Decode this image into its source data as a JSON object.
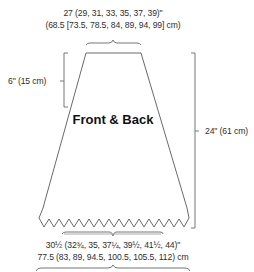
{
  "diagram": {
    "piece_label": "Front & Back",
    "top_width": {
      "inches": "27 (29, 31, 33, 35, 37, 39)\"",
      "cm": "(68.5 [73.5, 78.5, 84, 89, 94, 99] cm)"
    },
    "bottom_width": {
      "inches": "30½ (32¾, 35, 37¼,  39½, 41½, 44)\"",
      "cm": "77.5 (83, 89, 94.5, 100.5, 105.5, 112) cm"
    },
    "upper_depth": "6\" (15 cm)",
    "total_length": "24\" (61 cm)",
    "colors": {
      "line": "#6a6a6a",
      "text": "#2e2e2e",
      "title": "#111111"
    }
  }
}
